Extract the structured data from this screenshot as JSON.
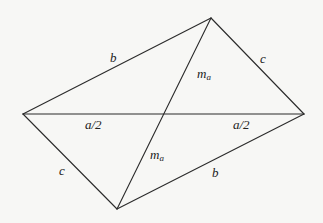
{
  "diagram": {
    "background": "#f7f7f5",
    "stroke_color": "#2b2b2b",
    "vertices": {
      "top": [
        211,
        18
      ],
      "left": [
        23,
        114
      ],
      "right": [
        304,
        114
      ],
      "bottom": [
        117,
        209
      ],
      "center": [
        164,
        114
      ]
    },
    "edges": [
      {
        "id": "top-left",
        "from": "top",
        "to": "left",
        "label": "b"
      },
      {
        "id": "top-right",
        "from": "top",
        "to": "right",
        "label": "c"
      },
      {
        "id": "left-bottom",
        "from": "left",
        "to": "bottom",
        "label": "c"
      },
      {
        "id": "bottom-right",
        "from": "bottom",
        "to": "right",
        "label": "b"
      },
      {
        "id": "left-right",
        "from": "left",
        "to": "right",
        "label": "a"
      },
      {
        "id": "top-bottom",
        "from": "top",
        "to": "bottom",
        "label": "2m_a"
      }
    ],
    "labels": {
      "b_upper": {
        "text": "b",
        "x": 110,
        "y": 62
      },
      "c_upper": {
        "text": "c",
        "x": 260,
        "y": 63
      },
      "ma_upper": {
        "main": "m",
        "sub": "a",
        "x": 197,
        "y": 78
      },
      "a2_left": {
        "text": "a/2",
        "x": 85,
        "y": 129
      },
      "a2_right": {
        "text": "a/2",
        "x": 233,
        "y": 129
      },
      "ma_lower": {
        "main": "m",
        "sub": "a",
        "x": 150,
        "y": 159
      },
      "c_lower": {
        "text": "c",
        "x": 59,
        "y": 175
      },
      "b_lower": {
        "text": "b",
        "x": 212,
        "y": 177
      }
    }
  }
}
